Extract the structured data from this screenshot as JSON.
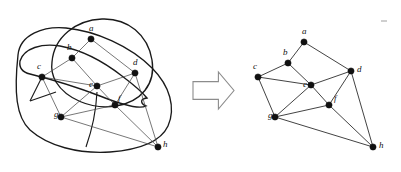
{
  "figure": {
    "arrow": {
      "name": "transform-arrow",
      "direction": "right",
      "x": 193,
      "y": 72,
      "w": 41,
      "h": 37,
      "fill": "#ffffff",
      "stroke": "#8c8c8c"
    },
    "style": {
      "background": "#ffffff",
      "node_color": "#111111",
      "edge_color": "#4a4a4a",
      "region_color": "#1a1a1a",
      "label_color": "#111111",
      "node_radius": 3.1,
      "label_font_size": 9
    }
  },
  "left_diagram": {
    "name": "region-diagram",
    "caption": "",
    "nodes": [
      {
        "id": "a",
        "label": "a",
        "x": 91,
        "y": 39,
        "lx": 89,
        "ly": 31
      },
      {
        "id": "b",
        "label": "b",
        "x": 72,
        "y": 58,
        "lx": 67,
        "ly": 50
      },
      {
        "id": "c",
        "label": "c",
        "x": 42,
        "y": 77,
        "lx": 37,
        "ly": 69
      },
      {
        "id": "d",
        "label": "d",
        "x": 135,
        "y": 73,
        "lx": 133,
        "ly": 65
      },
      {
        "id": "e",
        "label": "e",
        "x": 97,
        "y": 86,
        "lx": 89,
        "ly": 87
      },
      {
        "id": "f",
        "label": "f",
        "x": 115,
        "y": 105,
        "lx": 118,
        "ly": 101
      },
      {
        "id": "g",
        "label": "g",
        "x": 61,
        "y": 117,
        "lx": 54,
        "ly": 117
      },
      {
        "id": "h",
        "label": "h",
        "x": 158,
        "y": 147,
        "lx": 163,
        "ly": 147
      }
    ],
    "edges": [
      [
        "a",
        "b"
      ],
      [
        "a",
        "d"
      ],
      [
        "b",
        "c"
      ],
      [
        "b",
        "e"
      ],
      [
        "c",
        "e"
      ],
      [
        "c",
        "g"
      ],
      [
        "d",
        "e"
      ],
      [
        "d",
        "f"
      ],
      [
        "d",
        "h"
      ],
      [
        "e",
        "f"
      ],
      [
        "e",
        "g"
      ],
      [
        "f",
        "g"
      ],
      [
        "f",
        "h"
      ],
      [
        "g",
        "h"
      ]
    ],
    "regions": [
      {
        "name": "outer-region-boundary",
        "path": "M 18 55 C 20 34 44 26 66 28 C 96 31 130 46 152 68 C 170 86 176 108 168 126 C 160 143 136 150 110 152 C 78 154 48 146 30 130 C 16 117 14 92 18 55 Z"
      },
      {
        "name": "upper-lens-region",
        "path": "M 52 62 C 54 37 76 20 102 19 C 128 18 148 35 152 60 C 156 84 141 102 116 106 C 90 110 66 98 56 82 C 52 75 51 69 52 62 Z"
      },
      {
        "name": "inner-pocket-region",
        "path": "M 20 61 C 24 48 42 43 60 46 C 82 50 104 62 122 76 C 134 85 142 92 147 98 C 139 99 141 104 146 106 C 138 110 120 104 100 96 C 74 86 46 78 30 74 C 22 72 19 67 20 61 Z"
      }
    ],
    "dividers": [
      {
        "name": "divider-c-left",
        "path": "M 42 77 L 30 101"
      },
      {
        "name": "divider-e-down",
        "path": "M 97 92 C 96 112 92 130 86 147"
      },
      {
        "name": "divider-lower",
        "path": "M 56 92 L 30 101"
      }
    ]
  },
  "right_diagram": {
    "name": "planar-graph",
    "caption": "",
    "nodes": [
      {
        "id": "a",
        "label": "a",
        "x": 304,
        "y": 42,
        "lx": 302,
        "ly": 34
      },
      {
        "id": "b",
        "label": "b",
        "x": 288,
        "y": 63,
        "lx": 283,
        "ly": 55
      },
      {
        "id": "c",
        "label": "c",
        "x": 258,
        "y": 77,
        "lx": 253,
        "ly": 69
      },
      {
        "id": "d",
        "label": "d",
        "x": 351,
        "y": 71,
        "lx": 357,
        "ly": 72
      },
      {
        "id": "e",
        "label": "e",
        "x": 311,
        "y": 85,
        "lx": 303,
        "ly": 87
      },
      {
        "id": "f",
        "label": "f",
        "x": 329,
        "y": 105,
        "lx": 334,
        "ly": 101
      },
      {
        "id": "g",
        "label": "g",
        "x": 275,
        "y": 117,
        "lx": 268,
        "ly": 118
      },
      {
        "id": "h",
        "label": "h",
        "x": 373,
        "y": 147,
        "lx": 379,
        "ly": 148
      }
    ],
    "edges": [
      [
        "a",
        "b"
      ],
      [
        "a",
        "d"
      ],
      [
        "b",
        "c"
      ],
      [
        "b",
        "e"
      ],
      [
        "c",
        "e"
      ],
      [
        "c",
        "g"
      ],
      [
        "d",
        "e"
      ],
      [
        "d",
        "f"
      ],
      [
        "d",
        "h"
      ],
      [
        "e",
        "f"
      ],
      [
        "e",
        "g"
      ],
      [
        "f",
        "g"
      ],
      [
        "f",
        "h"
      ],
      [
        "g",
        "h"
      ]
    ]
  },
  "specks": [
    {
      "name": "speck-mark",
      "x": 381,
      "y": 20,
      "w": 6,
      "h": 2
    }
  ]
}
